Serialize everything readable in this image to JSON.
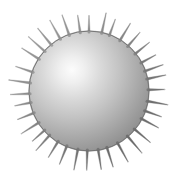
{
  "scene": {
    "title": "Spiked Sphere 3D Render",
    "subject_name": "spiked-sphere",
    "background_color": "#ffffff",
    "canvas": {
      "width": 179,
      "height": 184
    }
  },
  "sphere": {
    "center_x": 89,
    "center_y": 91,
    "radius": 60,
    "highlight_x": 72,
    "highlight_y": 70,
    "highlight_radius": 8,
    "color_highlight": "#fbfbfb",
    "color_mid": "#bdbdbd",
    "color_shadow": "#8e8e8e",
    "color_rim": "#6e6e6e",
    "outline_color": "#707070"
  },
  "spikes": {
    "count": 36,
    "length": 19,
    "base_width": 2.6,
    "tip_width": 0.5,
    "base_inset": 4,
    "color_light": "#9a9a9a",
    "color_dark": "#666666",
    "tip_color": "#b8b8b8"
  },
  "labels": {
    "caption": ""
  }
}
